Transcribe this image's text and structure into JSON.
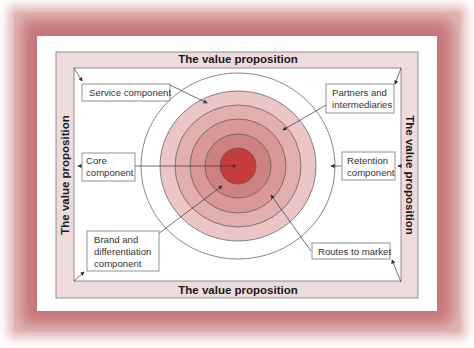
{
  "diagram": {
    "border_labels": {
      "top": "The value proposition",
      "bottom": "The value proposition",
      "left": "The value proposition",
      "right": "The value proposition"
    },
    "components": [
      {
        "id": "service",
        "lines": [
          "Service component"
        ]
      },
      {
        "id": "partners",
        "lines": [
          "Partners and",
          "intermediaries"
        ]
      },
      {
        "id": "core",
        "lines": [
          "Core",
          "component"
        ]
      },
      {
        "id": "retention",
        "lines": [
          "Retention",
          "component"
        ]
      },
      {
        "id": "brand",
        "lines": [
          "Brand and",
          "differentiation",
          "component"
        ]
      },
      {
        "id": "routes",
        "lines": [
          "Routes to market"
        ]
      }
    ],
    "colors": {
      "frame": "#c7767a",
      "band": "#eedcdd",
      "ring_outer": "#ecc6c6",
      "ring_2": "#e3aeae",
      "ring_3": "#d99797",
      "ring_4": "#ce8181",
      "ring_5": "#c46a6a",
      "core": "#c63c3c"
    }
  }
}
